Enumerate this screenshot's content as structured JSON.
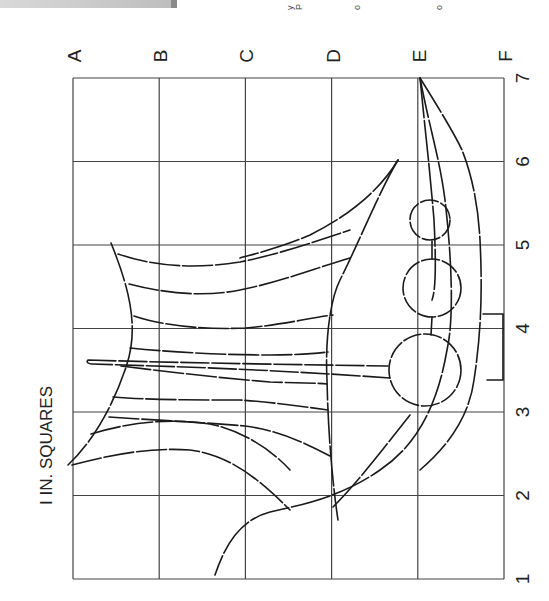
{
  "figure": {
    "scale_note": "I IN. SQUARES",
    "grid": {
      "column_labels": [
        "A",
        "B",
        "C",
        "D",
        "E",
        "F"
      ],
      "row_labels": [
        "7",
        "6",
        "5",
        "4",
        "3",
        "2",
        "1"
      ],
      "columns": 5,
      "rows": 6,
      "square_size": "1 in."
    },
    "orientation": "rotated 90° counter-clockwise",
    "line_color": "#1a1a1a",
    "grid_color": "#444444",
    "cutoff_fragments": [
      "y",
      "P",
      "o",
      "o"
    ]
  }
}
